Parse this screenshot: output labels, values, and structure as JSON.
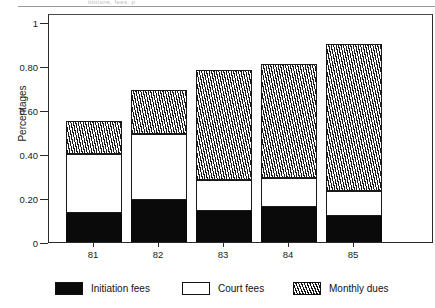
{
  "figure": {
    "caption_fragment": "tititions, fees, p"
  },
  "chart_data": {
    "type": "bar",
    "subtype": "stacked",
    "title": "",
    "xlabel": "",
    "ylabel": "Percentages",
    "categories": [
      "81",
      "82",
      "83",
      "84",
      "85"
    ],
    "ylim": [
      0,
      1
    ],
    "ytick_labels": [
      "0",
      "0.20",
      "0.40",
      "0.60",
      "0.80",
      "1"
    ],
    "ytick_values": [
      0,
      0.2,
      0.4,
      0.6,
      0.8,
      1
    ],
    "grid": false,
    "legend_position": "bottom",
    "series": [
      {
        "name": "Initiation fees",
        "fill": "solid-black",
        "color": "#0a0a0a",
        "values": [
          0.13,
          0.19,
          0.14,
          0.16,
          0.12
        ]
      },
      {
        "name": "Court fees",
        "fill": "solid-white",
        "color": "#ffffff",
        "values": [
          0.27,
          0.3,
          0.14,
          0.13,
          0.11
        ]
      },
      {
        "name": "Monthly dues",
        "fill": "diagonal-hatch",
        "color": "#1a1a1a",
        "values": [
          0.15,
          0.2,
          0.5,
          0.52,
          0.67
        ]
      }
    ],
    "totals": [
      0.55,
      0.69,
      0.78,
      0.81,
      0.9
    ]
  },
  "axis": {
    "y_title": "Percentages",
    "y_ticks": [
      {
        "label": "1",
        "value": 1.0
      },
      {
        "label": "0.80",
        "value": 0.8
      },
      {
        "label": "0.60",
        "value": 0.6
      },
      {
        "label": "0.40",
        "value": 0.4
      },
      {
        "label": "0.20",
        "value": 0.2
      },
      {
        "label": "0",
        "value": 0.0
      }
    ]
  },
  "legend": {
    "items": [
      {
        "label": "Initiation fees",
        "swatch": "black"
      },
      {
        "label": "Court fees",
        "swatch": "white"
      },
      {
        "label": "Monthly dues",
        "swatch": "hatch"
      }
    ]
  }
}
